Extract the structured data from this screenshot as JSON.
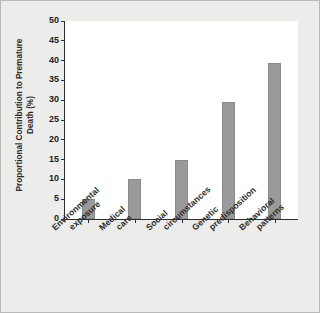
{
  "chart_data": {
    "type": "bar",
    "title": "",
    "xlabel": "",
    "ylabel": "Proportional Contribution to Premature Death (%)",
    "ylabel_lines": [
      "Proportional Contribution to Premature",
      "Death (%)"
    ],
    "categories": [
      "Environmental exposure",
      "Medical care",
      "Social circumstances",
      "Genetic predisposition",
      "Behavioral patterns"
    ],
    "category_lines": [
      [
        "Environmental",
        "exposure"
      ],
      [
        "Medical",
        "care"
      ],
      [
        "Social",
        "circumstances"
      ],
      [
        "Genetic",
        "predisposition"
      ],
      [
        "Behavioral",
        "patterns"
      ]
    ],
    "values": [
      5,
      10,
      15,
      29.5,
      39.5
    ],
    "ylim": [
      0,
      50
    ],
    "ytick_step": 5,
    "yticks": [
      0,
      5,
      10,
      15,
      20,
      25,
      30,
      35,
      40,
      45,
      50
    ],
    "ytick_labels": [
      "0",
      "5",
      "10",
      "15",
      "20",
      "25",
      "30",
      "35",
      "40",
      "45",
      "50"
    ],
    "grid": false,
    "legend": false,
    "bar_color": "#9a9a9a",
    "axis_color": "#2e2e2e",
    "plot_background": "#ffffff",
    "figure_background": "#ececeb"
  }
}
